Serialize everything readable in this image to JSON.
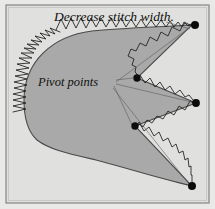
{
  "figure": {
    "type": "sewing-appliqué-technique-diagram",
    "width": 215,
    "height": 209,
    "background_color": "#e3e3e1",
    "frame": {
      "border_color": "#8d8d8b",
      "inner_fill": "#e0e0de"
    }
  },
  "labels": {
    "title": "Decrease stitch width.",
    "pivot": "Pivot points"
  },
  "shape": {
    "name": "appliqué-patch",
    "fill_color": "#a9a9a9",
    "outline_color": "#4a4a4a",
    "description": "leaf-like patch with three concave notches on the right edge"
  },
  "stitching": {
    "name": "zigzag-satin-stitch",
    "color": "#1c1c1c",
    "description": "zigzag stitches worked along the patch edge, narrowing toward each pivot point"
  },
  "pivot_points": [
    {
      "id": "pivot-top-right",
      "x": 195,
      "y": 25,
      "label": "outer point"
    },
    {
      "id": "pivot-inner-upper",
      "x": 137,
      "y": 78,
      "label": "inner notch"
    },
    {
      "id": "pivot-middle-right",
      "x": 196,
      "y": 103,
      "label": "outer point"
    },
    {
      "id": "pivot-inner-lower",
      "x": 135,
      "y": 126,
      "label": "inner notch"
    },
    {
      "id": "pivot-bottom-right",
      "x": 192,
      "y": 186,
      "label": "outer point"
    }
  ],
  "leader_lines": {
    "color": "#5d5d5d",
    "from_title": [
      {
        "x1": 166,
        "y1": 22,
        "x2": 190,
        "y2": 29
      }
    ],
    "from_pivot_label": [
      {
        "x1": 116,
        "y1": 80,
        "x2": 133,
        "y2": 78
      },
      {
        "x1": 116,
        "y1": 82,
        "x2": 189,
        "y2": 28
      },
      {
        "x1": 116,
        "y1": 84,
        "x2": 192,
        "y2": 102
      },
      {
        "x1": 114,
        "y1": 86,
        "x2": 132,
        "y2": 125
      },
      {
        "x1": 113,
        "y1": 88,
        "x2": 189,
        "y2": 184
      }
    ]
  }
}
